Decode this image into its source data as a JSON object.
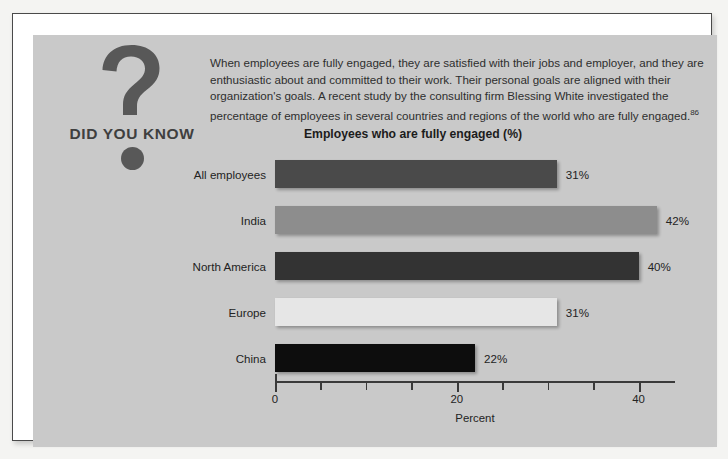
{
  "badge": {
    "label": "DID YOU KNOW",
    "icon": "question-mark-icon"
  },
  "intro": {
    "paragraph": "When employees are fully engaged, they are satisfied with their jobs and employer, and they are enthusiastic about and committed to their work. Their personal goals are aligned with their organization's goals. A recent study by the consulting firm Blessing White investigated the percentage of employees in several countries and regions of the world who are fully engaged.",
    "footnote": "86"
  },
  "chart_data": {
    "type": "bar",
    "orientation": "horizontal",
    "title": "Employees who are fully engaged (%)",
    "xlabel": "Percent",
    "ylabel": "",
    "categories": [
      "All employees",
      "India",
      "North America",
      "Europe",
      "China"
    ],
    "values": [
      31,
      42,
      40,
      31,
      22
    ],
    "value_labels": [
      "31%",
      "42%",
      "40%",
      "31%",
      "22%"
    ],
    "bar_colors": [
      "#4a4a4a",
      "#8d8d8d",
      "#333333",
      "#e6e6e6",
      "#0d0d0d"
    ],
    "xlim": [
      0,
      44
    ],
    "xticks": [
      0,
      20,
      40
    ],
    "xtick_labels": [
      "0",
      "20",
      "40"
    ],
    "minor_tick_step": 5,
    "grid": false,
    "legend": "none"
  },
  "colors": {
    "panel_background": "#c9c9c9",
    "frame_border": "#4a4a4a",
    "text": "#232323"
  }
}
